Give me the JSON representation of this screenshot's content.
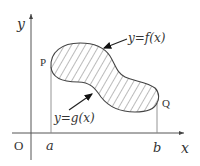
{
  "diagram": {
    "axes": {
      "x_label": "x",
      "y_label": "y",
      "origin_label": "O"
    },
    "bounds": {
      "left_label": "a",
      "right_label": "b"
    },
    "points": {
      "left_point": "P",
      "right_point": "Q"
    },
    "curves": {
      "upper": "y=f(x)",
      "lower": "y=g(x)"
    },
    "region": {
      "fill": "hatched",
      "description": "region bounded by y=f(x) above and y=g(x) below, from x=a to x=b"
    },
    "colors": {
      "axis": "#555555",
      "outline": "#444444",
      "hatch": "#555555",
      "text": "#333333"
    }
  }
}
